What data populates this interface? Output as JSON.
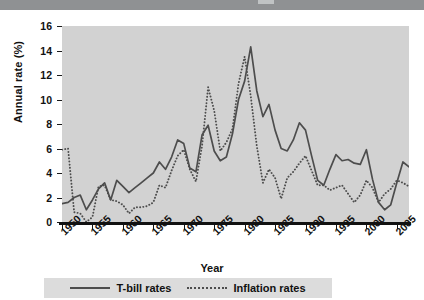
{
  "header": {
    "bar_color": "#8f9193"
  },
  "axes": {
    "ylabel": "Annual rate (%)",
    "xlabel": "Year",
    "yticks": [
      "0",
      "2",
      "4",
      "6",
      "8",
      "10",
      "12",
      "14",
      "16"
    ],
    "xticks": [
      "1950",
      "1955",
      "1960",
      "1965",
      "1970",
      "1975",
      "1980",
      "1985",
      "1990",
      "1995",
      "2000",
      "2005"
    ]
  },
  "legend": {
    "items": [
      {
        "label": "T-bill rates",
        "style": "solid",
        "color": "#4d4d4d"
      },
      {
        "label": "Inflation rates",
        "style": "dotted",
        "color": "#4d4d4d"
      }
    ]
  },
  "chart_data": {
    "type": "line",
    "title": "",
    "xlabel": "Year",
    "ylabel": "Annual rate (%)",
    "xlim": [
      1950,
      2007
    ],
    "ylim": [
      0,
      16
    ],
    "grid": false,
    "legend_position": "bottom",
    "plot_background": "#d2d2d2",
    "x": [
      1950,
      1951,
      1952,
      1953,
      1954,
      1955,
      1956,
      1957,
      1958,
      1959,
      1960,
      1961,
      1962,
      1963,
      1964,
      1965,
      1966,
      1967,
      1968,
      1969,
      1970,
      1971,
      1972,
      1973,
      1974,
      1975,
      1976,
      1977,
      1978,
      1979,
      1980,
      1981,
      1982,
      1983,
      1984,
      1985,
      1986,
      1987,
      1988,
      1989,
      1990,
      1991,
      1992,
      1993,
      1994,
      1995,
      1996,
      1997,
      1998,
      1999,
      2000,
      2001,
      2002,
      2003,
      2004,
      2005,
      2006,
      2007
    ],
    "series": [
      {
        "name": "T-bill rates",
        "style": "solid",
        "color": "#4d4d4d",
        "values": [
          1.5,
          1.6,
          2.0,
          2.2,
          1.0,
          1.8,
          2.7,
          3.2,
          1.8,
          3.4,
          2.9,
          2.4,
          2.8,
          3.2,
          3.6,
          4.0,
          4.9,
          4.3,
          5.3,
          6.7,
          6.4,
          4.4,
          4.1,
          7.1,
          7.9,
          5.8,
          5.0,
          5.3,
          7.2,
          10.0,
          11.5,
          14.3,
          10.7,
          8.6,
          9.6,
          7.5,
          6.0,
          5.8,
          6.7,
          8.1,
          7.5,
          5.4,
          3.4,
          3.0,
          4.3,
          5.5,
          5.0,
          5.1,
          4.8,
          4.7,
          5.9,
          3.5,
          1.6,
          1.0,
          1.4,
          3.2,
          4.9,
          4.5
        ]
      },
      {
        "name": "Inflation rates",
        "style": "dotted",
        "color": "#4d4d4d",
        "values": [
          5.9,
          6.0,
          0.8,
          0.7,
          -0.4,
          0.4,
          2.9,
          3.0,
          1.8,
          1.7,
          1.4,
          0.7,
          1.2,
          1.2,
          1.3,
          1.6,
          3.0,
          2.8,
          4.2,
          5.4,
          5.9,
          4.3,
          3.3,
          6.2,
          11.0,
          9.1,
          5.8,
          6.5,
          7.6,
          11.3,
          13.5,
          10.3,
          6.2,
          3.2,
          4.3,
          3.6,
          1.9,
          3.6,
          4.1,
          4.8,
          5.4,
          4.2,
          3.0,
          3.0,
          2.6,
          2.8,
          3.0,
          2.3,
          1.6,
          2.2,
          3.4,
          2.8,
          1.6,
          2.3,
          2.7,
          3.4,
          3.2,
          2.9
        ]
      }
    ]
  }
}
